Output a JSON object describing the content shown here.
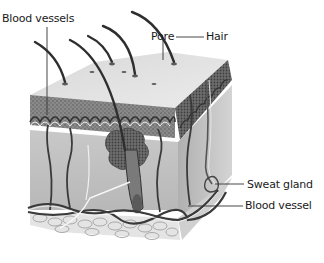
{
  "diagram": {
    "labels": {
      "blood_vessels": "Blood vessels",
      "pore": "Pore",
      "hair": "Hair",
      "sweat_gland": "Sweat gland",
      "blood_vessel": "Blood vessel"
    },
    "colors": {
      "background": "#ffffff",
      "epidermis_top": "#e2e2e2",
      "epidermis_layer": "#8c8c8c",
      "dermis": "#c4c4c4",
      "fat_layer": "#e6e6e6",
      "vessel": "#3a3a3a",
      "hair": "#2e2e2e",
      "label_text": "#1a1a1a"
    }
  }
}
